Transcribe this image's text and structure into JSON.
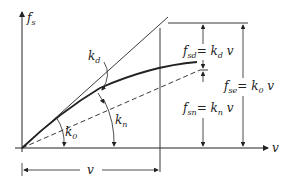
{
  "diagram": {
    "y_axis_label": "f",
    "y_axis_sub": "s",
    "x_axis_label": "v",
    "curve_labels": {
      "kd": {
        "main": "k",
        "sub": "d"
      },
      "k0": {
        "main": "k",
        "sub": "0"
      },
      "kn": {
        "main": "k",
        "sub": "n"
      }
    },
    "dimension_labels": {
      "fsd": {
        "main": "f",
        "sub": "sd",
        "eq": "= k",
        "eq_sub": "d",
        "tail": " v"
      },
      "fsn": {
        "main": "f",
        "sub": "sn",
        "eq": "= k",
        "eq_sub": "n",
        "tail": " v"
      },
      "fse": {
        "main": "f",
        "sub": "se",
        "eq": "= k",
        "eq_sub": "0",
        "tail": " v"
      }
    },
    "v_dimension_label": "v",
    "colors": {
      "line": "#222222",
      "background": "#ffffff"
    }
  }
}
